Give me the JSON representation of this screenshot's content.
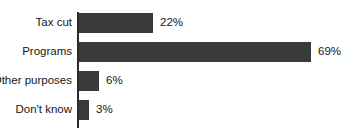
{
  "chart_data": {
    "type": "bar",
    "orientation": "horizontal",
    "title": "",
    "xlabel": "",
    "ylabel": "",
    "categories": [
      "Tax cut",
      "Programs",
      "Other purposes",
      "Don't know"
    ],
    "values": [
      22,
      69,
      6,
      3
    ],
    "value_labels": [
      "22%",
      "69%",
      "6%",
      "3%"
    ],
    "value_unit": "%",
    "xlim": [
      0,
      69
    ],
    "grid": false,
    "legend": false,
    "bar_color": "#3a3a3a",
    "axis_color": "#2b2b2b",
    "background_color": "#ffffff"
  },
  "axis": {
    "name": "category-axis"
  }
}
